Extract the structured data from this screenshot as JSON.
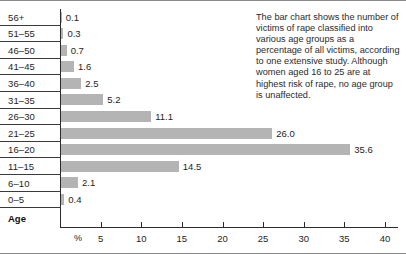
{
  "chart_data": {
    "type": "bar",
    "orientation": "horizontal",
    "title": "",
    "xlabel": "%",
    "ylabel": "Age",
    "xlim": [
      0,
      40
    ],
    "xticks": [
      5,
      10,
      15,
      20,
      25,
      30,
      35,
      40
    ],
    "grid": false,
    "legend": null,
    "bar_color": "#b4b4b4",
    "categories": [
      "56+",
      "51–55",
      "46–50",
      "41–45",
      "36–40",
      "31–35",
      "26–30",
      "21–25",
      "16–20",
      "11–15",
      "6–10",
      "0–5"
    ],
    "values": [
      0.1,
      0.3,
      0.7,
      1.6,
      2.5,
      5.2,
      11.1,
      26.0,
      35.6,
      14.5,
      2.1,
      0.4
    ],
    "value_labels": [
      "0.1",
      "0.3",
      "0.7",
      "1.6",
      "2.5",
      "5.2",
      "11.1",
      "26.0",
      "35.6",
      "14.5",
      "2.1",
      "0.4"
    ]
  },
  "caption": {
    "text": "The bar chart shows the number of victims of rape classified into various age groups as a percentage of all victims, according to one extensive study. Although women aged 16 to 25 are at highest risk of rape, no age group is unaffected."
  },
  "axis": {
    "y_title": "Age",
    "x_unit": "%"
  }
}
